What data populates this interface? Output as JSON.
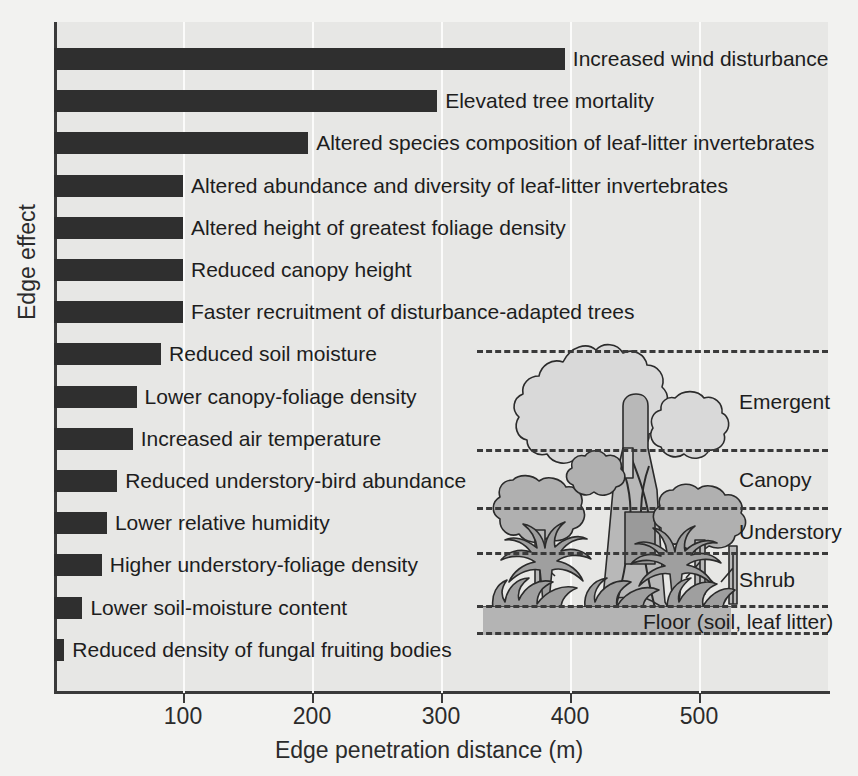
{
  "chart_data": {
    "type": "bar",
    "orientation": "horizontal",
    "title": "",
    "xlabel": "Edge penetration distance (m)",
    "ylabel": "Edge effect",
    "xlim": [
      0,
      600
    ],
    "xticks": [
      100,
      200,
      300,
      400,
      500
    ],
    "xtick_labels": [
      "100",
      "200",
      "300",
      "400",
      "500"
    ],
    "grid": "vertical-white-gridlines",
    "legend": "none",
    "bar_color": "#2f2f2f",
    "units": "m",
    "categories": [
      "Increased wind disturbance",
      "Elevated tree mortality",
      "Altered species composition of leaf-litter invertebrates",
      "Altered abundance and diversity of leaf-litter invertebrates",
      "Altered height of greatest foliage density",
      "Reduced canopy height",
      "Faster recruitment of disturbance-adapted trees",
      "Reduced soil moisture",
      "Lower canopy-foliage density",
      "Increased air temperature",
      "Reduced understory-bird abundance",
      "Lower relative humidity",
      "Higher understory-foliage density",
      "Lower soil-moisture content",
      "Reduced density of fungal fruiting bodies"
    ],
    "values": [
      396,
      297,
      197,
      100,
      100,
      100,
      100,
      83,
      64,
      61,
      49,
      41,
      37,
      22,
      8
    ]
  },
  "axes": {
    "x_title": "Edge penetration distance (m)",
    "y_title": "Edge effect",
    "x_ticks": [
      "100",
      "200",
      "300",
      "400",
      "500"
    ]
  },
  "inset": {
    "name": "rainforest-strata-diagram",
    "strata": [
      {
        "label": "Emergent"
      },
      {
        "label": "Canopy"
      },
      {
        "label": "Understory"
      },
      {
        "label": "Shrub"
      },
      {
        "label": "Floor (soil, leaf litter)"
      }
    ]
  },
  "colors": {
    "background": "#f2f2f0",
    "plot_background": "#e7e7e5",
    "bar": "#2f2f2f",
    "axis": "#3a3a3a",
    "gridline": "#fbfbfa",
    "foliage_light": "#d3d3d3",
    "foliage_mid": "#b0b0b0",
    "floor": "#b4b4b4"
  }
}
